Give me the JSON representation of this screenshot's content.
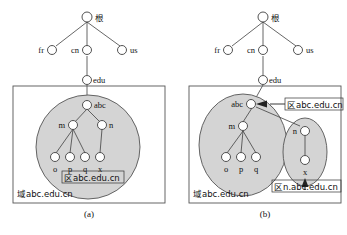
{
  "figure": {
    "colors": {
      "zone_fill": "#d4d4d4",
      "stroke": "#404040",
      "node_fill": "#ffffff",
      "panel_border": "#555555",
      "text": "#111111"
    },
    "panels": [
      {
        "id": "a",
        "caption": "(a)",
        "tree": {
          "root": {
            "label": "根",
            "is_cjk": true
          },
          "level1": [
            {
              "label": "fr",
              "side": "left"
            },
            {
              "label": "cn",
              "side": "center"
            },
            {
              "label": "us",
              "side": "right"
            }
          ],
          "level2": [
            {
              "label": "edu",
              "parent": "cn"
            }
          ],
          "level3": [
            {
              "label": "abc",
              "parent": "edu"
            }
          ],
          "level4": [
            {
              "label": "m",
              "parent": "abc"
            },
            {
              "label": "n",
              "parent": "abc"
            }
          ],
          "level5": [
            {
              "label": "o",
              "parent": "m"
            },
            {
              "label": "p",
              "parent": "m"
            },
            {
              "label": "q",
              "parent": "m"
            },
            {
              "label": "x",
              "parent": "n"
            }
          ]
        },
        "zone_shape": "circle",
        "zone_labels": [
          {
            "text": "区abc.edu.cn",
            "boxed": true,
            "position": "inside-circle-bottom"
          }
        ],
        "domain_label": {
          "text": "域abc.edu.cn",
          "boxed": false,
          "position": "panel-bottom-left"
        }
      },
      {
        "id": "b",
        "caption": "(b)",
        "tree": {
          "root": {
            "label": "根",
            "is_cjk": true
          },
          "level1": [
            {
              "label": "fr",
              "side": "left"
            },
            {
              "label": "cn",
              "side": "center"
            },
            {
              "label": "us",
              "side": "right"
            }
          ],
          "level2": [
            {
              "label": "edu",
              "parent": "cn"
            }
          ],
          "level3": [
            {
              "label": "abc",
              "parent": "edu"
            }
          ],
          "level4": [
            {
              "label": "m",
              "parent": "abc"
            },
            {
              "label": "n",
              "parent": "abc"
            }
          ],
          "level5": [
            {
              "label": "o",
              "parent": "m"
            },
            {
              "label": "p",
              "parent": "m"
            },
            {
              "label": "q",
              "parent": "m"
            },
            {
              "label": "x",
              "parent": "n"
            }
          ]
        },
        "zone_shape": "two-ovals",
        "zone_labels": [
          {
            "text": "区abc.edu.cn",
            "boxed": true,
            "position": "right-of-abc",
            "has_leader_line": true
          },
          {
            "text": "区n.abc.edu.cn",
            "boxed": true,
            "position": "below-right-oval",
            "has_arrow": true
          }
        ],
        "domain_label": {
          "text": "域abc.edu.cn",
          "boxed": false,
          "position": "panel-bottom-left"
        }
      }
    ]
  }
}
